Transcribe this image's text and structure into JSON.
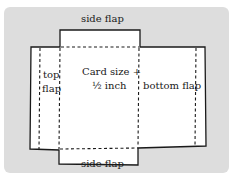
{
  "diagram": {
    "labels": {
      "top_side_flap": "side flap",
      "bottom_side_flap": "side flap",
      "top_flap_line1": "top",
      "top_flap_line2": "flap",
      "center_line1": "Card size +",
      "center_line2": "½ inch",
      "bottom_flap": "bottom flap"
    },
    "colors": {
      "background": "#dddddd",
      "paper": "#ffffff",
      "line": "#1a1a1a"
    }
  }
}
